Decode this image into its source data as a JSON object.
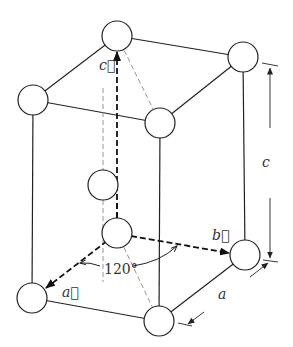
{
  "diagram": {
    "vector_labels": {
      "a": "a⃗",
      "b": "b⃗",
      "c": "c⃗"
    },
    "angle_label": "120°",
    "dimension_labels": {
      "c": "c",
      "a": "a"
    },
    "colors": {
      "stroke": "#222222",
      "dashed_light": "#777777",
      "background": "#ffffff"
    },
    "atoms": [
      {
        "name": "top-back",
        "x": 117,
        "y": 36
      },
      {
        "name": "top-right",
        "x": 243,
        "y": 57
      },
      {
        "name": "top-left",
        "x": 33,
        "y": 100
      },
      {
        "name": "top-front",
        "x": 160,
        "y": 123
      },
      {
        "name": "middle",
        "x": 103,
        "y": 185
      },
      {
        "name": "bottom-origin",
        "x": 117,
        "y": 233
      },
      {
        "name": "bottom-right",
        "x": 245,
        "y": 255
      },
      {
        "name": "bottom-left",
        "x": 32,
        "y": 298
      },
      {
        "name": "bottom-front",
        "x": 159,
        "y": 321
      }
    ]
  }
}
